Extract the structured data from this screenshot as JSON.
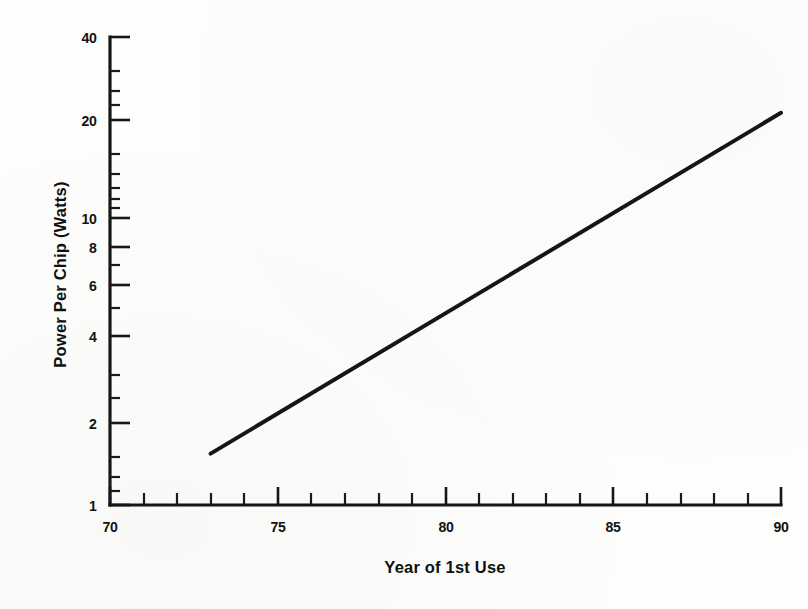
{
  "figure": {
    "background_color": "#fdfdfc",
    "ink_color": "#151515"
  },
  "chart_data": {
    "type": "line",
    "title": "",
    "subtitle": "",
    "xlabel": "Year of 1st Use",
    "ylabel": "Power Per Chip (Watts)",
    "xlim": [
      70,
      90
    ],
    "ylim": [
      1,
      40
    ],
    "yscale": "log",
    "xscale": "linear",
    "grid": false,
    "legend": false,
    "legend_position": "none",
    "annotations": [],
    "x_ticks_major": [
      70,
      75,
      80,
      85,
      90
    ],
    "x_tick_labels": [
      "70",
      "75",
      "80",
      "85",
      "90"
    ],
    "x_ticks_minor": [
      71,
      72,
      73,
      74,
      76,
      77,
      78,
      79,
      81,
      82,
      83,
      84,
      86,
      87,
      88,
      89
    ],
    "y_ticks": [
      1,
      2,
      4,
      6,
      8,
      10,
      20,
      40
    ],
    "y_tick_labels": [
      "1",
      "2",
      "4",
      "6",
      "8",
      "10",
      "20",
      "40"
    ],
    "series": [
      {
        "name": "Power Per Chip",
        "x": [
          73,
          74,
          75,
          76,
          77,
          78,
          79,
          80,
          81,
          82,
          83,
          84,
          85,
          86,
          87,
          88,
          89,
          90
        ],
        "values": [
          1.5,
          1.68,
          1.88,
          2.1,
          2.36,
          2.64,
          2.96,
          3.31,
          3.71,
          4.16,
          4.66,
          5.22,
          5.85,
          6.55,
          7.34,
          8.22,
          9.21,
          10.3
        ],
        "y_display": [
          1.5,
          1.68,
          1.88,
          2.1,
          2.36,
          2.64,
          2.96,
          3.31,
          3.71,
          4.16,
          4.66,
          5.22,
          5.85,
          6.55,
          7.34,
          8.22,
          9.21,
          10.3
        ],
        "endpoints": {
          "start": {
            "x": 73,
            "y": 1.5
          },
          "end": {
            "x": 90,
            "y": 22
          }
        },
        "fit": "exponential",
        "line_style": "solid",
        "color": "#151515"
      }
    ]
  }
}
